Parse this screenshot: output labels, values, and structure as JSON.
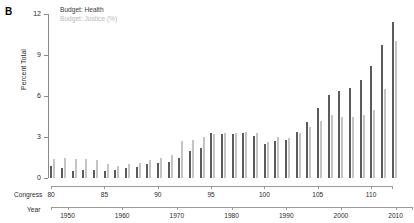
{
  "panel": {
    "label": "B"
  },
  "legend": {
    "items": [
      {
        "label": "Budget: Health",
        "color": "#3a3a3a",
        "key": "health"
      },
      {
        "label": "Budget: Justice (%)",
        "color": "#b8b8b8",
        "key": "justice"
      }
    ]
  },
  "axes": {
    "y": {
      "label": "Percent Total",
      "ticks": [
        0,
        3,
        6,
        9,
        12
      ],
      "min": 0,
      "max": 12
    },
    "congress": {
      "name": "Congress",
      "ticks": [
        80,
        85,
        90,
        95,
        100,
        105,
        110
      ],
      "min": 80,
      "max": 112
    },
    "year": {
      "name": "Year",
      "ticks": [
        1950,
        1960,
        1970,
        1980,
        1990,
        2000,
        2010
      ],
      "min": 1947,
      "max": 2013
    }
  },
  "chart_data": {
    "type": "bar",
    "title": "",
    "xlabel": "Congress",
    "ylabel": "Percent Total",
    "ylim": [
      0,
      12
    ],
    "xlim": [
      80,
      112
    ],
    "grid": false,
    "legend_position": "top-left",
    "categories": [
      80,
      81,
      82,
      83,
      84,
      85,
      86,
      87,
      88,
      89,
      90,
      91,
      92,
      93,
      94,
      95,
      96,
      97,
      98,
      99,
      100,
      101,
      102,
      103,
      104,
      105,
      106,
      107,
      108,
      109,
      110,
      111,
      112
    ],
    "years": [
      1947,
      1949,
      1951,
      1953,
      1955,
      1957,
      1959,
      1961,
      1963,
      1965,
      1967,
      1969,
      1971,
      1973,
      1975,
      1977,
      1979,
      1981,
      1983,
      1985,
      1987,
      1989,
      1991,
      1993,
      1995,
      1997,
      1999,
      2001,
      2003,
      2005,
      2007,
      2009,
      2011
    ],
    "series": [
      {
        "name": "Budget: Health",
        "color": "#5b5b5b",
        "values": [
          0.9,
          0.7,
          0.5,
          0.6,
          0.6,
          0.5,
          0.6,
          0.7,
          0.8,
          1.0,
          1.1,
          1.2,
          1.5,
          2.0,
          2.2,
          3.3,
          3.2,
          3.2,
          3.3,
          3.1,
          2.5,
          2.7,
          2.8,
          3.4,
          4.1,
          5.1,
          6.1,
          6.4,
          6.6,
          7.2,
          8.2,
          9.7,
          11.4
        ],
        "ylim": [
          0,
          12
        ]
      },
      {
        "name": "Budget: Justice (%)",
        "color": "#c4c4c4",
        "values": [
          1.4,
          1.5,
          1.4,
          1.4,
          1.3,
          1.0,
          0.9,
          1.0,
          1.1,
          1.3,
          1.5,
          1.7,
          2.7,
          2.8,
          3.0,
          3.2,
          3.3,
          3.3,
          3.4,
          3.3,
          2.6,
          3.0,
          2.9,
          3.3,
          3.7,
          4.2,
          4.6,
          4.5,
          4.5,
          4.6,
          5.0,
          6.5,
          10.0
        ],
        "ylim": [
          0,
          12
        ]
      }
    ]
  }
}
